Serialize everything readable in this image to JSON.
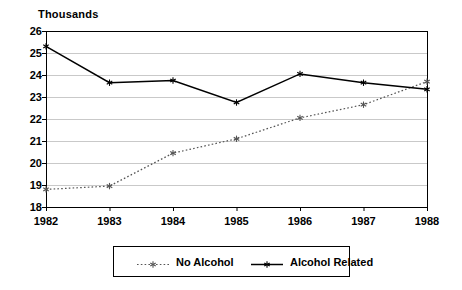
{
  "chart_data": {
    "type": "line",
    "title": "",
    "ylabel": "Thousands",
    "xlabel": "",
    "categories": [
      "1982",
      "1983",
      "1984",
      "1985",
      "1986",
      "1987",
      "1988"
    ],
    "x": [
      1982,
      1983,
      1984,
      1985,
      1986,
      1987,
      1988
    ],
    "ylim": [
      18,
      26
    ],
    "yticks": [
      18,
      19,
      20,
      21,
      22,
      23,
      24,
      25,
      26
    ],
    "ytick_labels": [
      "18",
      "19",
      "20",
      "21",
      "22",
      "23",
      "24",
      "25",
      "26"
    ],
    "grid": true,
    "grid_axis": "y",
    "legend_position": "bottom",
    "series": [
      {
        "name": "No Alcohol",
        "values": [
          18.8,
          18.95,
          20.45,
          21.1,
          22.05,
          22.65,
          23.7
        ],
        "line_style": "dotted",
        "color": "#555555",
        "marker": "asterisk"
      },
      {
        "name": "Alcohol Related",
        "values": [
          25.3,
          23.65,
          23.75,
          22.75,
          24.05,
          23.65,
          23.35
        ],
        "line_style": "solid",
        "color": "#000000",
        "marker": "asterisk"
      }
    ]
  },
  "legend": {
    "entries": [
      {
        "label": "No Alcohol"
      },
      {
        "label": "Alcohol Related"
      }
    ]
  },
  "axis": {
    "y_title": "Thousands"
  },
  "colors": {
    "frame": "#000000",
    "grid": "#c9c9c9",
    "series_no_alcohol": "#555555",
    "series_alcohol_related": "#000000",
    "background": "#ffffff"
  }
}
